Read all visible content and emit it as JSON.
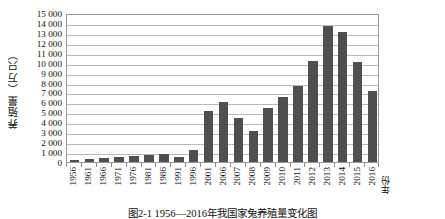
{
  "figure": {
    "caption": "图2-1 1956—2016年我国家兔养殖量变化图"
  },
  "axes": {
    "y_title": "养殖量（万只）",
    "x_title": "年份",
    "y_ticks": [
      "0",
      "1 000",
      "2 000",
      "3 000",
      "4 000",
      "5 000",
      "6 000",
      "7 000",
      "8 000",
      "9 000",
      "10 000",
      "11 000",
      "12 000",
      "13 000",
      "14 000",
      "15 000"
    ]
  },
  "style": {
    "bar_color": "#4f4f4f",
    "gridline_color": "#b9b9b9",
    "axis_color": "#9a9a9a",
    "background": "#ffffff"
  },
  "chart_data": {
    "type": "bar",
    "title": "图2-1 1956—2016年我国家兔养殖量变化图",
    "xlabel": "年份",
    "ylabel": "养殖量（万只）",
    "ylim": [
      0,
      15000
    ],
    "ytick_step": 1000,
    "grid": true,
    "legend": "none",
    "categories": [
      "1956",
      "1961",
      "1966",
      "1971",
      "1976",
      "1981",
      "1986",
      "1991",
      "1996",
      "2001",
      "2006",
      "2007",
      "2008",
      "2009",
      "2010",
      "2011",
      "2012",
      "2013",
      "2014",
      "2015",
      "2016"
    ],
    "values": [
      220,
      330,
      360,
      480,
      600,
      700,
      760,
      520,
      1200,
      5100,
      6000,
      4400,
      3100,
      5400,
      6500,
      7700,
      10200,
      13700,
      13100,
      10100,
      7100
    ],
    "series": [
      {
        "name": "养殖量（万只）",
        "values": [
          220,
          330,
          360,
          480,
          600,
          700,
          760,
          520,
          1200,
          5100,
          6000,
          4400,
          3100,
          5400,
          6500,
          7700,
          10200,
          13700,
          13100,
          10100,
          7100
        ]
      }
    ]
  }
}
